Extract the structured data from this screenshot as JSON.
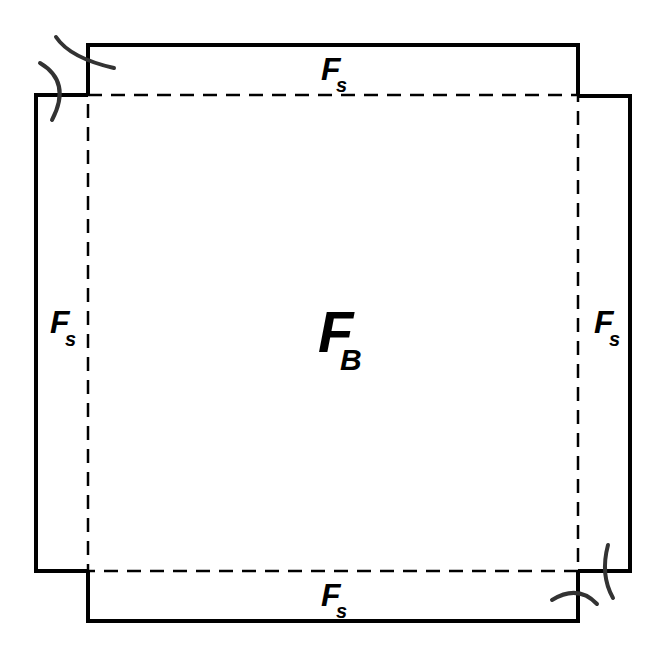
{
  "diagram": {
    "colors": {
      "stroke": "#000000",
      "curve": "#333333",
      "background": "#ffffff"
    },
    "center_label": {
      "main": "F",
      "subscript": "B"
    },
    "edge_labels": {
      "top": {
        "main": "F",
        "subscript": "s"
      },
      "bottom": {
        "main": "F",
        "subscript": "s"
      },
      "left": {
        "main": "F",
        "subscript": "s"
      },
      "right": {
        "main": "F",
        "subscript": "s"
      }
    },
    "shapes": {
      "central_square": "dashed",
      "outer_flaps": [
        "top",
        "bottom",
        "left",
        "right"
      ],
      "corner_arcs": [
        "top-left",
        "bottom-right"
      ]
    }
  }
}
